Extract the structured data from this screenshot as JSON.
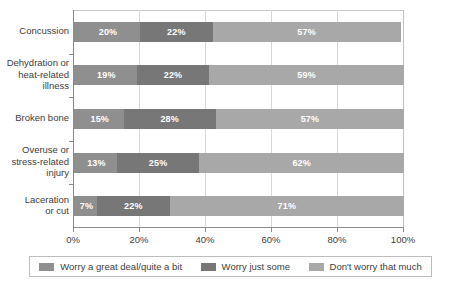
{
  "chart_data": {
    "type": "bar",
    "subtype": "stacked-horizontal-bar",
    "title": "",
    "xlabel": "",
    "ylabel": "",
    "xlim": [
      0,
      100
    ],
    "grid": true,
    "legend_position": "bottom",
    "categories": [
      "Concussion",
      "Dehydration or heat-related illness",
      "Broken bone",
      "Overuse or stress-related injury",
      "Laceration or cut"
    ],
    "category_lines": [
      [
        "Concussion"
      ],
      [
        "Dehydration or",
        "heat-related",
        "illness"
      ],
      [
        "Broken bone"
      ],
      [
        "Overuse or",
        "stress-related",
        "injury"
      ],
      [
        "Laceration",
        "or cut"
      ]
    ],
    "series": [
      {
        "name": "Worry a great deal/quite a bit",
        "color": "#8f8f8f",
        "values": [
          20,
          19,
          15,
          13,
          7
        ],
        "labels": [
          "20%",
          "19%",
          "15%",
          "13%",
          "7%"
        ]
      },
      {
        "name": "Worry just some",
        "color": "#777777",
        "values": [
          22,
          22,
          28,
          25,
          22
        ],
        "labels": [
          "22%",
          "22%",
          "28%",
          "25%",
          "22%"
        ]
      },
      {
        "name": "Don't worry that much",
        "color": "#a8a8a8",
        "values": [
          57,
          59,
          57,
          62,
          71
        ],
        "labels": [
          "57%",
          "59%",
          "57%",
          "62%",
          "71%"
        ]
      }
    ],
    "xticks": [
      0,
      20,
      40,
      60,
      80,
      100
    ],
    "xtick_labels": [
      "0%",
      "20%",
      "40%",
      "60%",
      "80%",
      "100%"
    ]
  },
  "legend": {
    "items": [
      {
        "label": "Worry a great deal/quite a bit",
        "swatch": "legend-swatch-series-0"
      },
      {
        "label": "Worry just some",
        "swatch": "legend-swatch-series-1"
      },
      {
        "label": "Don't worry that much",
        "swatch": "legend-swatch-series-2"
      }
    ]
  }
}
